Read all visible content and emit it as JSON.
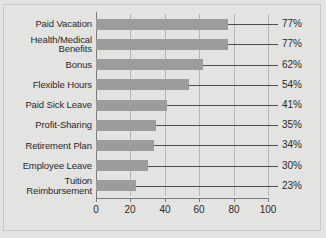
{
  "chart_data": {
    "type": "bar",
    "orientation": "horizontal",
    "title": "",
    "subtitle": "",
    "xlabel": "",
    "ylabel": "",
    "xlim": [
      0,
      100
    ],
    "xticks": [
      0,
      20,
      40,
      60,
      80,
      100
    ],
    "xtick_labels": [
      "0",
      "20",
      "40",
      "60",
      "80",
      "100"
    ],
    "grid": true,
    "grid_axis": "x",
    "legend": false,
    "legend_position": "none",
    "bar_color": "#9c9c9a",
    "background_color": "#e3e3e1",
    "gridline_color": "#b6b6b4",
    "axis_color": "#7a7a7a",
    "text_color": "#2a2a2a",
    "leader_line_color": "#4d4d4d",
    "categories": [
      "Paid Vacation",
      "Health/Medical\nBenefits",
      "Bonus",
      "Flexible Hours",
      "Paid Sick Leave",
      "Profit-Sharing",
      "Retirement Plan",
      "Employee Leave",
      "Tuition\nReimbursement"
    ],
    "values": [
      77,
      77,
      62,
      54,
      41,
      35,
      34,
      30,
      23
    ],
    "data_labels": [
      "77%",
      "77%",
      "62%",
      "54%",
      "41%",
      "35%",
      "34%",
      "30%",
      "23%"
    ]
  }
}
